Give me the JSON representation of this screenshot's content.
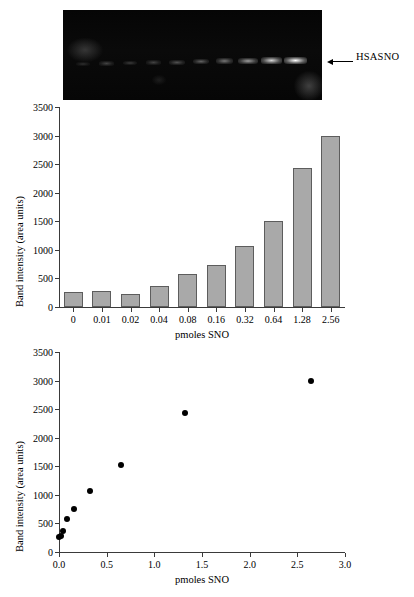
{
  "gel": {
    "name": "gel-blot",
    "label": "HSASNO",
    "arrow_icon": "left-arrow-icon",
    "lane_count": 10,
    "lane_intensities": [
      0.18,
      0.3,
      0.26,
      0.3,
      0.38,
      0.46,
      0.55,
      0.7,
      0.88,
      1.0
    ]
  },
  "chart_data": [
    {
      "type": "bar",
      "name": "band-intensity-bar-chart",
      "title": "",
      "xlabel": "pmoles SNO",
      "ylabel": "Band intensity (area units)",
      "categories": [
        "0",
        "0.01",
        "0.02",
        "0.04",
        "0.08",
        "0.16",
        "0.32",
        "0.64",
        "1.28",
        "2.56"
      ],
      "values": [
        265,
        285,
        230,
        375,
        580,
        740,
        1070,
        1510,
        2425,
        2990
      ],
      "ylim": [
        0,
        3500
      ],
      "yticks": [
        0,
        500,
        1000,
        1500,
        2000,
        2500,
        3000,
        3500
      ],
      "ytick_labels": [
        "0",
        "500",
        "1000",
        "1500",
        "2000",
        "2500",
        "3000",
        "3500"
      ],
      "grid": false,
      "legend": "none",
      "bar_color": "#a9a9a9",
      "bar_edge_color": "#5d5d5d"
    },
    {
      "type": "scatter",
      "name": "band-intensity-scatter-chart",
      "title": "",
      "xlabel": "pmoles SNO",
      "ylabel": "Band intensity (area units)",
      "x": [
        0.0,
        0.02,
        0.04,
        0.08,
        0.16,
        0.33,
        0.65,
        1.32,
        2.64
      ],
      "y": [
        265,
        285,
        375,
        580,
        755,
        1075,
        1520,
        2440,
        2990
      ],
      "xlim": [
        0.0,
        3.0
      ],
      "ylim": [
        0,
        3500
      ],
      "xticks": [
        0.0,
        0.5,
        1.0,
        1.5,
        2.0,
        2.5,
        3.0
      ],
      "xtick_labels": [
        "0.0",
        "0.5",
        "1.0",
        "1.5",
        "2.0",
        "2.5",
        "3.0"
      ],
      "yticks": [
        0,
        500,
        1000,
        1500,
        2000,
        2500,
        3000,
        3500
      ],
      "ytick_labels": [
        "0",
        "500",
        "1000",
        "1500",
        "2000",
        "2500",
        "3000",
        "3500"
      ],
      "grid": false,
      "legend": "none",
      "marker_color": "#000000"
    }
  ]
}
